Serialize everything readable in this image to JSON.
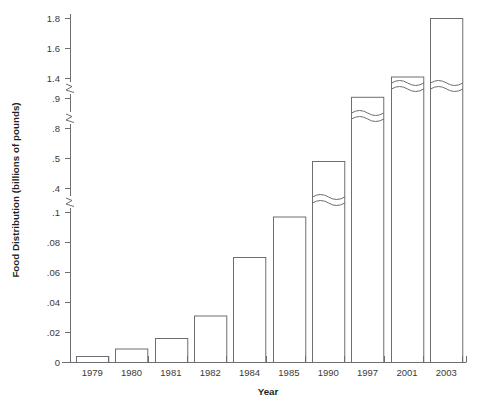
{
  "chart_data": {
    "type": "bar",
    "title": "",
    "xlabel": "Year",
    "ylabel": "Food Distribution (billions of pounds)",
    "categories": [
      "1979",
      "1980",
      "1981",
      "1982",
      "1984",
      "1985",
      "1990",
      "1997",
      "2001",
      "2003"
    ],
    "values": [
      0.004,
      0.009,
      0.016,
      0.031,
      0.07,
      0.097,
      0.49,
      0.93,
      1.41,
      1.8
    ],
    "ytick_labels": [
      "0",
      ".02",
      ".04",
      ".06",
      ".08",
      ".1",
      ".4",
      ".5",
      ".8",
      ".9",
      "1.4",
      "1.6",
      "1.8"
    ],
    "ytick_values": [
      0,
      0.02,
      0.04,
      0.06,
      0.08,
      0.1,
      0.4,
      0.5,
      0.8,
      0.9,
      1.4,
      1.6,
      1.8
    ],
    "axis_broken": true,
    "axis_break_count": 3,
    "axis_break_after_labels": [
      ".1",
      ".5",
      ".9"
    ],
    "bars_with_break_marks": [
      "1990",
      "1997",
      "2001",
      "2003"
    ],
    "grid": false,
    "legend": false,
    "bar_fill_color": "#ffffff",
    "bar_edge_color": "#6d6e71",
    "text_color": "#231f20"
  },
  "axis": {
    "y_title": "Food Distribution (billions of pounds)",
    "x_title": "Year"
  },
  "yticks": [
    {
      "label": "1.8"
    },
    {
      "label": "1.6"
    },
    {
      "label": "1.4"
    },
    {
      "label": ".9"
    },
    {
      "label": ".8"
    },
    {
      "label": ".5"
    },
    {
      "label": ".4"
    },
    {
      "label": ".1"
    },
    {
      "label": ".08"
    },
    {
      "label": ".06"
    },
    {
      "label": ".04"
    },
    {
      "label": ".02"
    },
    {
      "label": "0"
    }
  ],
  "xticks": [
    {
      "label": "1979"
    },
    {
      "label": "1980"
    },
    {
      "label": "1981"
    },
    {
      "label": "1982"
    },
    {
      "label": "1984"
    },
    {
      "label": "1985"
    },
    {
      "label": "1990"
    },
    {
      "label": "1997"
    },
    {
      "label": "2001"
    },
    {
      "label": "2003"
    }
  ]
}
